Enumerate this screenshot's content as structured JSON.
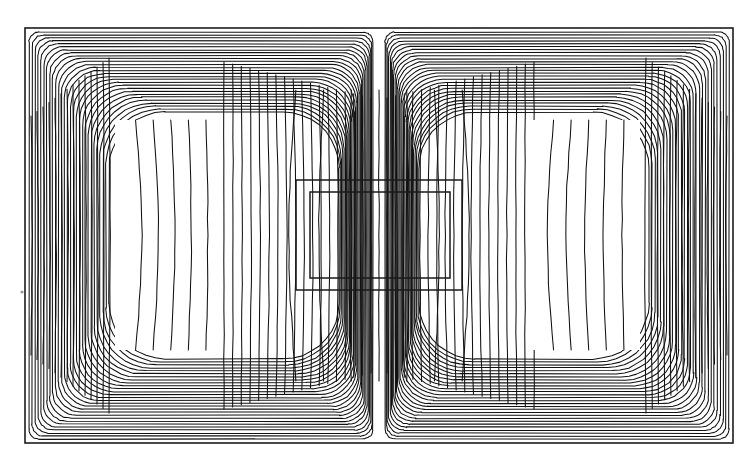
{
  "page": {
    "background_color": "#ffffff",
    "width": 756,
    "height": 465,
    "clipped_text_line": "the observer standing at B say. Thus permeable completely throughout"
  },
  "figure": {
    "name": "magnetic-field-contour-plot",
    "border_color": "#1c1c1c",
    "line_color": "#111111",
    "fill_color": "#ffffff",
    "frame": {
      "x": 25,
      "y": 28,
      "width": 708,
      "height": 415
    }
  },
  "chart_data": {
    "type": "line",
    "title": "",
    "subtitle": "",
    "xlabel": "",
    "ylabel": "",
    "grid": false,
    "legend": "none",
    "plot_kind": "contour",
    "xlim": [
      0,
      708
    ],
    "ylim": [
      0,
      415
    ],
    "contour_levels": 28,
    "symmetry": "left-right mirror about vertical centerline",
    "regions": [
      {
        "name": "outer-frame",
        "shape": "rectangle",
        "x": 25,
        "y": 28,
        "width": 708,
        "height": 415,
        "filled": false
      },
      {
        "name": "left-coil-window",
        "shape": "rectangle",
        "x": 115,
        "y": 120,
        "width": 107,
        "height": 230,
        "filled": true,
        "fill": "#ffffff"
      },
      {
        "name": "right-coil-window",
        "shape": "rectangle",
        "x": 533,
        "y": 120,
        "width": 107,
        "height": 230,
        "filled": true,
        "fill": "#ffffff"
      },
      {
        "name": "center-outer-rectangle",
        "shape": "rectangle",
        "x": 296,
        "y": 180,
        "width": 166,
        "height": 110,
        "filled": false
      },
      {
        "name": "center-inner-rectangle",
        "shape": "rectangle",
        "x": 310,
        "y": 192,
        "width": 140,
        "height": 86,
        "filled": false
      }
    ],
    "notes": [
      "Contours bunch densely at the inner corners of the two coil windows",
      "Field lines run nearly vertically through the central rectangle",
      "Outermost contours loop around the whole core hugging the outer frame",
      "A narrow vertical gap of sparse lines runs down the exact centre of the figure"
    ]
  }
}
